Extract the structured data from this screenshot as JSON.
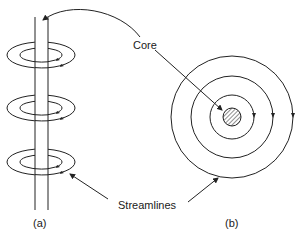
{
  "diagram": {
    "labels": {
      "core": "Core",
      "streamlines": "Streamlines",
      "panel_a": "(a)",
      "panel_b": "(b)"
    },
    "panel_a": {
      "description": "Vortex core rod with circular streamlines (side view)",
      "streamline_rings": 3
    },
    "panel_b": {
      "description": "Concentric streamlines around hatched core (top view)",
      "concentric_circles": 3
    },
    "colors": {
      "line": "#222222",
      "background": "#ffffff"
    }
  }
}
